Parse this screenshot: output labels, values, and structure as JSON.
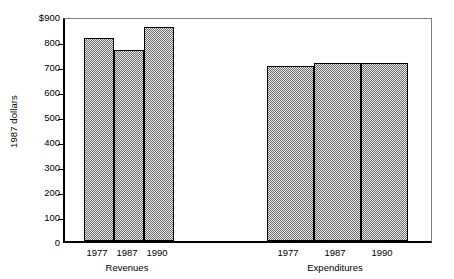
{
  "chart_data": {
    "type": "bar",
    "title": "",
    "subtitle": "",
    "xlabel": "",
    "ylabel": "1987 dollars",
    "ylim": [
      0,
      900
    ],
    "ytick_values": [
      0,
      100,
      200,
      300,
      400,
      500,
      600,
      700,
      800,
      900
    ],
    "ytick_labels": [
      "0",
      "100",
      "200",
      "300",
      "400",
      "500",
      "600",
      "700",
      "800",
      "$900"
    ],
    "grid": false,
    "legend": "none",
    "groups": [
      {
        "label": "Revenues",
        "categories": [
          "1977",
          "1987",
          "1990"
        ],
        "values": [
          812,
          764,
          856
        ]
      },
      {
        "label": "Expenditures",
        "categories": [
          "1977",
          "1987",
          "1990"
        ],
        "values": [
          700,
          712,
          712
        ]
      }
    ],
    "categories": [
      "1977",
      "1987",
      "1990",
      "1977",
      "1987",
      "1990"
    ],
    "values": [
      812,
      764,
      856,
      700,
      712,
      712
    ],
    "bar_fill_color": "#b4b4b4",
    "bar_edge_color": "#000000",
    "axis_color": "#000000",
    "background_color": "#ffffff"
  },
  "bars": [
    {
      "name": "revenues-1977",
      "group": "Revenues",
      "category": "1977",
      "value": 812,
      "left_px": 19,
      "width_px": 30
    },
    {
      "name": "revenues-1987",
      "group": "Revenues",
      "category": "1987",
      "value": 764,
      "left_px": 49,
      "width_px": 30
    },
    {
      "name": "revenues-1990",
      "group": "Revenues",
      "category": "1990",
      "value": 856,
      "left_px": 79,
      "width_px": 30
    },
    {
      "name": "expenditures-1977",
      "group": "Expenditures",
      "category": "1977",
      "value": 700,
      "left_px": 202,
      "width_px": 47
    },
    {
      "name": "expenditures-1987",
      "group": "Expenditures",
      "category": "1987",
      "value": 712,
      "left_px": 249,
      "width_px": 47
    },
    {
      "name": "expenditures-1990",
      "group": "Expenditures",
      "category": "1990",
      "value": 712,
      "left_px": 296,
      "width_px": 47
    }
  ],
  "x_tick_label_positions": [
    {
      "label": "1977",
      "center_px": 97
    },
    {
      "label": "1987",
      "center_px": 127
    },
    {
      "label": "1990",
      "center_px": 157
    },
    {
      "label": "1977",
      "center_px": 288
    },
    {
      "label": "1987",
      "center_px": 335
    },
    {
      "label": "1990",
      "center_px": 382
    }
  ],
  "group_label_positions": [
    {
      "label": "Revenues",
      "center_px": 127
    },
    {
      "label": "Expenditures",
      "center_px": 335
    }
  ]
}
